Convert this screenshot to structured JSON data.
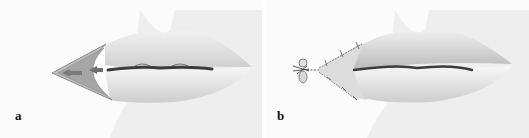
{
  "figure": {
    "panels": [
      {
        "id": "a",
        "label": "a",
        "description": "Lip commissure with wedge-shaped excision area and arrows indicating advancement toward the corner"
      },
      {
        "id": "b",
        "label": "b",
        "description": "Lips after closure showing sutured wedge at commissure with tied suture knot"
      }
    ]
  },
  "colors": {
    "background": "#fbfbfb",
    "lip_light": "#e6e6e6",
    "lip_mid": "#c8c8c8",
    "lip_dark": "#8a8a8a",
    "wedge": "#a9a9a9",
    "arrow": "#6f6f6f",
    "lip_line": "#3c3c3c"
  }
}
